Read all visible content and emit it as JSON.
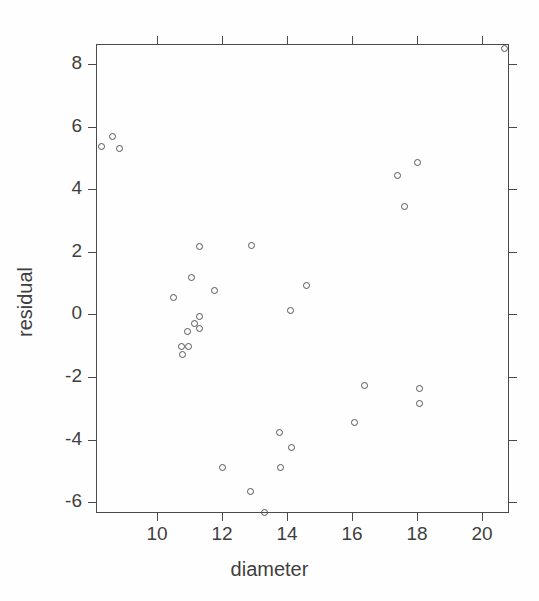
{
  "chart_data": {
    "type": "scatter",
    "title": "",
    "xlabel": "diameter",
    "ylabel": "residual",
    "xlim": [
      8.12,
      20.83
    ],
    "ylim": [
      -6.35,
      8.65
    ],
    "xticks": [
      10,
      12,
      14,
      16,
      18,
      20
    ],
    "yticks": [
      8,
      6,
      4,
      2,
      0,
      -2,
      -4,
      -6
    ],
    "xticklabels": [
      "10",
      "12",
      "14",
      "16",
      "18",
      "20"
    ],
    "yticklabels": [
      "8",
      "6",
      "4",
      "2",
      "0",
      "-2",
      "-4",
      "-6"
    ],
    "grid": false,
    "legend": null,
    "marker": "open-circle",
    "marker_color": "#555555",
    "frame_color": "#4a4a4a",
    "background": "#ffffff",
    "points": [
      {
        "x": 8.3,
        "y": 5.38
      },
      {
        "x": 8.64,
        "y": 5.68
      },
      {
        "x": 8.83,
        "y": 5.31
      },
      {
        "x": 10.51,
        "y": 0.53
      },
      {
        "x": 10.75,
        "y": -1.03
      },
      {
        "x": 10.79,
        "y": -1.29
      },
      {
        "x": 10.96,
        "y": -1.02
      },
      {
        "x": 10.95,
        "y": -0.55
      },
      {
        "x": 11.05,
        "y": 1.17
      },
      {
        "x": 11.16,
        "y": -0.29
      },
      {
        "x": 11.3,
        "y": -0.06
      },
      {
        "x": 11.3,
        "y": -0.45
      },
      {
        "x": 11.3,
        "y": 2.17
      },
      {
        "x": 11.76,
        "y": 0.78
      },
      {
        "x": 12.0,
        "y": -4.88
      },
      {
        "x": 12.92,
        "y": 2.19
      },
      {
        "x": 12.88,
        "y": -5.65
      },
      {
        "x": 13.32,
        "y": -6.32
      },
      {
        "x": 13.77,
        "y": -3.78
      },
      {
        "x": 13.8,
        "y": -4.89
      },
      {
        "x": 14.11,
        "y": 0.13
      },
      {
        "x": 14.15,
        "y": -4.26
      },
      {
        "x": 14.61,
        "y": 0.92
      },
      {
        "x": 16.07,
        "y": -3.44
      },
      {
        "x": 16.38,
        "y": -2.26
      },
      {
        "x": 17.4,
        "y": 4.43
      },
      {
        "x": 17.62,
        "y": 3.45
      },
      {
        "x": 18.02,
        "y": 4.85
      },
      {
        "x": 18.09,
        "y": -2.37
      },
      {
        "x": 18.07,
        "y": -2.86
      },
      {
        "x": 20.68,
        "y": 8.5
      }
    ]
  }
}
